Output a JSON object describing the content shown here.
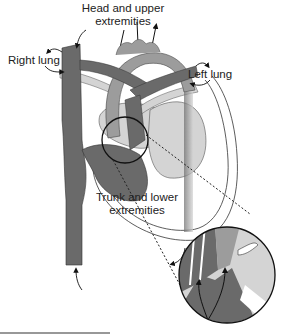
{
  "labels": {
    "head": [
      "Head and upper",
      "extremities"
    ],
    "right_lung": "Right lung",
    "left_lung": "Left lung",
    "trunk": [
      "Trunk and lower",
      "extremities"
    ]
  },
  "colors": {
    "dark": "#6a6a6a",
    "medium": "#9c9c9c",
    "light": "#d4d4d4",
    "outline": "#111111"
  }
}
